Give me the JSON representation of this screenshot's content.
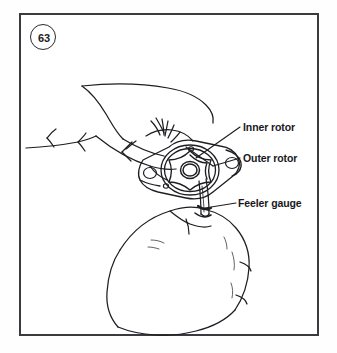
{
  "figure": {
    "number": "63",
    "caption_labels": {
      "inner_rotor": "Inner rotor",
      "outer_rotor": "Outer rotor",
      "feeler_gauge": "Feeler gauge"
    }
  },
  "colors": {
    "frame_stroke": "#3a3a3f",
    "line_art_stroke": "#1e1e22",
    "background": "#ffffff",
    "text": "#18181c"
  },
  "illustration": {
    "subject": "two hands measuring oil pump rotor clearance with a feeler gauge",
    "parts": [
      "upper-hand-fingers",
      "lower-hand-thumb",
      "oil-pump-body",
      "outer-rotor-ring",
      "inner-rotor-star",
      "rotor-center-bore",
      "feeler-gauge-blade",
      "mounting-hole-left",
      "mounting-hole-right"
    ]
  }
}
